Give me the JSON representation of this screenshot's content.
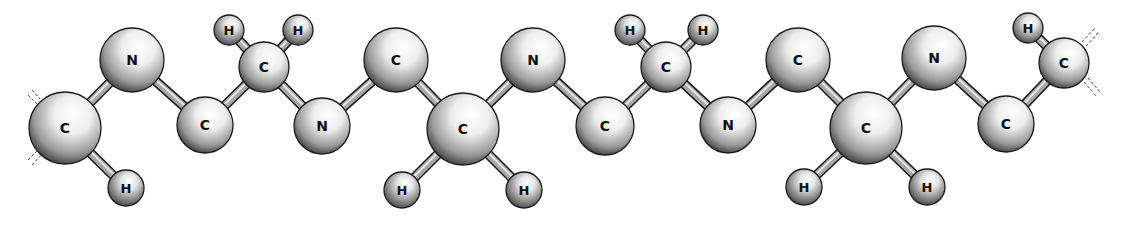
{
  "diagram": {
    "colors": {
      "bond": "#8a8a8a",
      "atom_outline": "#1a1a1a",
      "atom_highlight": "#ffffff",
      "atom_shadow": "#2a2a2a",
      "label": "#111111"
    },
    "atoms": [
      {
        "id": "a1",
        "element": "C",
        "x": 65,
        "y": 128,
        "r": 36
      },
      {
        "id": "a2",
        "element": "H",
        "x": 126,
        "y": 188,
        "r": 18
      },
      {
        "id": "a3",
        "element": "N",
        "x": 132,
        "y": 60,
        "r": 32
      },
      {
        "id": "a4",
        "element": "C",
        "x": 205,
        "y": 125,
        "r": 28
      },
      {
        "id": "a5",
        "element": "C",
        "x": 264,
        "y": 67,
        "r": 25
      },
      {
        "id": "a6",
        "element": "H",
        "x": 229,
        "y": 30,
        "r": 15
      },
      {
        "id": "a7",
        "element": "H",
        "x": 298,
        "y": 30,
        "r": 15
      },
      {
        "id": "a8",
        "element": "N",
        "x": 322,
        "y": 126,
        "r": 28
      },
      {
        "id": "a9",
        "element": "C",
        "x": 396,
        "y": 60,
        "r": 32
      },
      {
        "id": "a10",
        "element": "C",
        "x": 463,
        "y": 129,
        "r": 36
      },
      {
        "id": "a11",
        "element": "H",
        "x": 402,
        "y": 190,
        "r": 18
      },
      {
        "id": "a12",
        "element": "H",
        "x": 524,
        "y": 190,
        "r": 18
      },
      {
        "id": "a13",
        "element": "N",
        "x": 533,
        "y": 60,
        "r": 32
      },
      {
        "id": "a14",
        "element": "C",
        "x": 605,
        "y": 126,
        "r": 29
      },
      {
        "id": "a15",
        "element": "C",
        "x": 666,
        "y": 67,
        "r": 25
      },
      {
        "id": "a16",
        "element": "H",
        "x": 630,
        "y": 30,
        "r": 15
      },
      {
        "id": "a17",
        "element": "H",
        "x": 703,
        "y": 30,
        "r": 15
      },
      {
        "id": "a18",
        "element": "N",
        "x": 728,
        "y": 125,
        "r": 28
      },
      {
        "id": "a19",
        "element": "C",
        "x": 798,
        "y": 60,
        "r": 32
      },
      {
        "id": "a20",
        "element": "C",
        "x": 866,
        "y": 128,
        "r": 36
      },
      {
        "id": "a21",
        "element": "H",
        "x": 804,
        "y": 187,
        "r": 18
      },
      {
        "id": "a22",
        "element": "H",
        "x": 927,
        "y": 187,
        "r": 18
      },
      {
        "id": "a23",
        "element": "N",
        "x": 934,
        "y": 58,
        "r": 32
      },
      {
        "id": "a24",
        "element": "C",
        "x": 1006,
        "y": 124,
        "r": 28
      },
      {
        "id": "a25",
        "element": "C",
        "x": 1064,
        "y": 63,
        "r": 25
      },
      {
        "id": "a26",
        "element": "H",
        "x": 1028,
        "y": 28,
        "r": 15
      }
    ],
    "bonds": [
      [
        "a1",
        "a2"
      ],
      [
        "a1",
        "a3"
      ],
      [
        "a3",
        "a4"
      ],
      [
        "a4",
        "a5"
      ],
      [
        "a5",
        "a6"
      ],
      [
        "a5",
        "a7"
      ],
      [
        "a5",
        "a8"
      ],
      [
        "a8",
        "a9"
      ],
      [
        "a9",
        "a10"
      ],
      [
        "a10",
        "a11"
      ],
      [
        "a10",
        "a12"
      ],
      [
        "a10",
        "a13"
      ],
      [
        "a13",
        "a14"
      ],
      [
        "a14",
        "a15"
      ],
      [
        "a15",
        "a16"
      ],
      [
        "a15",
        "a17"
      ],
      [
        "a15",
        "a18"
      ],
      [
        "a18",
        "a19"
      ],
      [
        "a19",
        "a20"
      ],
      [
        "a20",
        "a21"
      ],
      [
        "a20",
        "a22"
      ],
      [
        "a20",
        "a23"
      ],
      [
        "a23",
        "a24"
      ],
      [
        "a24",
        "a25"
      ],
      [
        "a25",
        "a26"
      ]
    ],
    "chain_continuation": [
      {
        "side": "left",
        "x1": 28,
        "y1": 95,
        "x2": 38,
        "y2": 105
      },
      {
        "side": "left",
        "x1": 32,
        "y1": 90,
        "x2": 40,
        "y2": 99
      },
      {
        "side": "left",
        "x1": 28,
        "y1": 160,
        "x2": 40,
        "y2": 148
      },
      {
        "side": "left",
        "x1": 32,
        "y1": 165,
        "x2": 44,
        "y2": 152
      },
      {
        "side": "right",
        "x1": 1082,
        "y1": 42,
        "x2": 1095,
        "y2": 28
      },
      {
        "side": "right",
        "x1": 1086,
        "y1": 46,
        "x2": 1099,
        "y2": 32
      },
      {
        "side": "right",
        "x1": 1084,
        "y1": 82,
        "x2": 1096,
        "y2": 96
      },
      {
        "side": "right",
        "x1": 1088,
        "y1": 78,
        "x2": 1100,
        "y2": 92
      }
    ]
  }
}
